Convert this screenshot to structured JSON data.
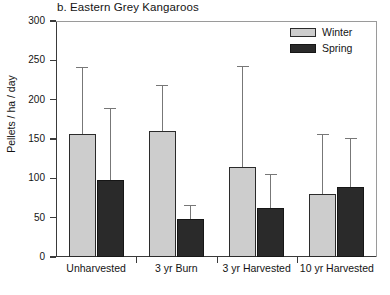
{
  "chart_data": {
    "type": "bar",
    "title": "b. Eastern Grey Kangaroos",
    "xlabel": "",
    "ylabel": "Pellets / ha / day",
    "ylim": [
      0,
      300
    ],
    "yticks": [
      0,
      50,
      100,
      150,
      200,
      250,
      300
    ],
    "ytick_labels": [
      "0",
      "50",
      "100",
      "150",
      "200",
      "250",
      "300"
    ],
    "grid": false,
    "legend_position": "top-right",
    "categories": [
      "Unharvested",
      "3 yr Burn",
      "3 yr Harvested",
      "10 yr Harvested"
    ],
    "series": [
      {
        "name": "Winter",
        "color": "#cdcdcd",
        "values": [
          156,
          160,
          114,
          80
        ],
        "error_upper": [
          86,
          59,
          129,
          76
        ],
        "error_top_values": [
          242,
          219,
          243,
          156
        ]
      },
      {
        "name": "Spring",
        "color": "#2a2a2a",
        "values": [
          98,
          48,
          62,
          89
        ],
        "error_upper": [
          92,
          18,
          44,
          62
        ],
        "error_top_values": [
          190,
          66,
          106,
          151
        ]
      }
    ]
  },
  "legend": {
    "entries": [
      {
        "label": "Winter"
      },
      {
        "label": "Spring"
      }
    ]
  }
}
